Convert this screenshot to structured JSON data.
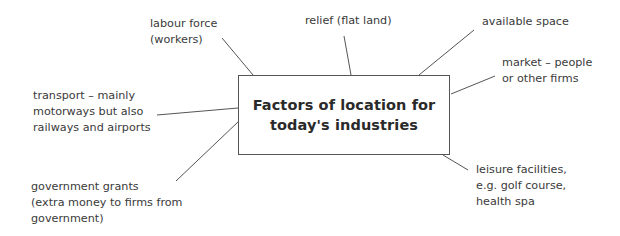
{
  "diagram": {
    "type": "spider-diagram",
    "central_topic": {
      "lines": [
        "Factors of location for",
        "today's industries"
      ]
    },
    "factors": [
      {
        "id": "labour",
        "lines": [
          "labour force",
          "(workers)"
        ]
      },
      {
        "id": "relief",
        "lines": [
          "relief (flat land)"
        ]
      },
      {
        "id": "space",
        "lines": [
          "available space"
        ]
      },
      {
        "id": "market",
        "lines": [
          "market – people",
          "or other firms"
        ]
      },
      {
        "id": "transport",
        "lines": [
          "transport – mainly",
          "motorways but also",
          "railways and airports"
        ]
      },
      {
        "id": "grants",
        "lines": [
          "government grants",
          "(extra money to firms from",
          "government)"
        ]
      },
      {
        "id": "leisure",
        "lines": [
          "leisure facilities,",
          "e.g. golf course,",
          "health spa"
        ]
      }
    ],
    "colors": {
      "line": "#555555",
      "text": "#3a3a3a",
      "title": "#2a2a2a",
      "background": "#ffffff"
    }
  }
}
